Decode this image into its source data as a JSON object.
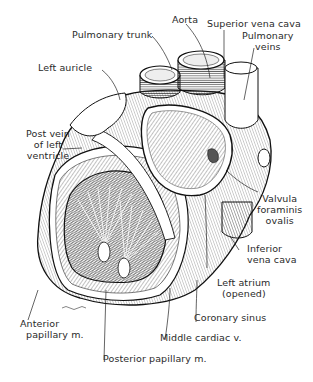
{
  "figure": {
    "signature": "Signed illustration mark"
  },
  "labels": {
    "aorta": "Aorta",
    "superior_vena_cava": "Superior vena cava",
    "pulmonary_trunk": "Pulmonary trunk",
    "pulmonary_veins": [
      "Pulmonary",
      "veins"
    ],
    "left_auricle": "Left auricle",
    "post_vein": [
      "Post vein",
      "of left",
      "ventricle"
    ],
    "valvula": [
      "Valvula",
      "foraminis",
      "ovalis"
    ],
    "inferior_vena_cava": [
      "Inferior",
      "vena cava"
    ],
    "left_atrium": [
      "Left atrium",
      "(opened)"
    ],
    "coronary_sinus": "Coronary sinus",
    "middle_cardiac_v": "Middle cardiac v.",
    "anterior_papillary": [
      "Anterior",
      "papillary m."
    ],
    "posterior_papillary": "Posterior papillary m."
  }
}
